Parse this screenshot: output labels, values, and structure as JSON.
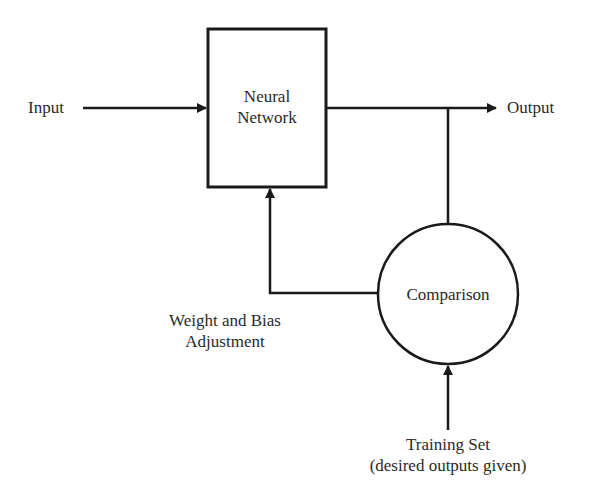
{
  "diagram": {
    "nodes": {
      "neural_network": {
        "line1": "Neural",
        "line2": "Network",
        "shape": "rectangle"
      },
      "comparison": {
        "label": "Comparison",
        "shape": "circle"
      }
    },
    "labels": {
      "input": "Input",
      "output": "Output",
      "weight_adjust_line1": "Weight and Bias",
      "weight_adjust_line2": "Adjustment",
      "training_line1": "Training Set",
      "training_line2": "(desired outputs given)"
    },
    "edges": [
      {
        "from": "Input",
        "to": "Neural Network"
      },
      {
        "from": "Neural Network",
        "to": "Output"
      },
      {
        "from": "Output branch",
        "to": "Comparison"
      },
      {
        "from": "Comparison",
        "to": "Neural Network",
        "label": "Weight and Bias Adjustment"
      },
      {
        "from": "Training Set",
        "to": "Comparison"
      }
    ],
    "colors": {
      "stroke": "#1a1a1a",
      "text": "#2a2a2a",
      "background": "#ffffff"
    }
  }
}
